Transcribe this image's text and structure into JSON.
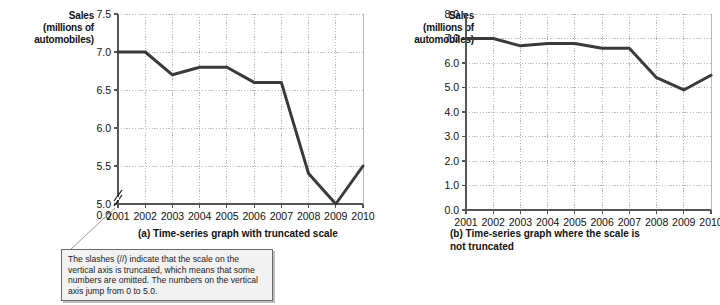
{
  "figures": {
    "a": {
      "axis_title_line1": "Sales",
      "axis_title_line2": "(millions of",
      "axis_title_line3": "automobiles)",
      "caption": "(a) Time-series graph with truncated scale"
    },
    "b": {
      "axis_title_line1": "Sales",
      "axis_title_line2": "(millions of",
      "axis_title_line3": "automobiles)",
      "caption_line1": "(b) Time-series graph where the scale is",
      "caption_line2": "not truncated"
    }
  },
  "callout": {
    "text": "The slashes (//) indicate that the scale on the vertical axis is truncated, which means that some numbers are omitted.  The numbers on the vertical axis jump from 0 to 5.0."
  },
  "colors": {
    "line": "#3a3a3a",
    "axis": "#555555",
    "grid": "#b9b9b9",
    "callout_bg": "#f2f2f2",
    "callout_border": "#6a6a6a"
  },
  "chart_data": [
    {
      "type": "line",
      "title": "(a) Time-series graph with truncated scale",
      "xlabel": "",
      "ylabel": "Sales (millions of automobiles)",
      "x": [
        2001,
        2002,
        2003,
        2004,
        2005,
        2006,
        2007,
        2008,
        2009,
        2010
      ],
      "categories": [
        "2001",
        "2002",
        "2003",
        "2004",
        "2005",
        "2006",
        "2007",
        "2008",
        "2009",
        "2010"
      ],
      "values": [
        7.0,
        7.0,
        6.7,
        6.8,
        6.8,
        6.6,
        6.6,
        5.4,
        4.9,
        5.5
      ],
      "ylim": [
        5.0,
        7.5
      ],
      "yticks": [
        "7.5",
        "7.0",
        "6.5",
        "6.0",
        "5.5",
        "5.0",
        "0.0"
      ],
      "ytick_values": [
        7.5,
        7.0,
        6.5,
        6.0,
        5.5,
        5.0,
        0.0
      ],
      "truncated_axis": true,
      "axis_break_between": [
        0.0,
        5.0
      ],
      "grid": true,
      "legend": "none"
    },
    {
      "type": "line",
      "title": "(b) Time-series graph where the scale is not truncated",
      "xlabel": "",
      "ylabel": "Sales (millions of automobiles)",
      "x": [
        2001,
        2002,
        2003,
        2004,
        2005,
        2006,
        2007,
        2008,
        2009,
        2010
      ],
      "categories": [
        "2001",
        "2002",
        "2003",
        "2004",
        "2005",
        "2006",
        "2007",
        "2008",
        "2009",
        "2010"
      ],
      "values": [
        7.0,
        7.0,
        6.7,
        6.8,
        6.8,
        6.6,
        6.6,
        5.4,
        4.9,
        5.5
      ],
      "ylim": [
        0.0,
        8.0
      ],
      "yticks": [
        "8.0",
        "7.0",
        "6.0",
        "5.0",
        "4.0",
        "3.0",
        "2.0",
        "1.0",
        "0.0"
      ],
      "ytick_values": [
        8.0,
        7.0,
        6.0,
        5.0,
        4.0,
        3.0,
        2.0,
        1.0,
        0.0
      ],
      "truncated_axis": false,
      "grid": true,
      "legend": "none"
    }
  ]
}
